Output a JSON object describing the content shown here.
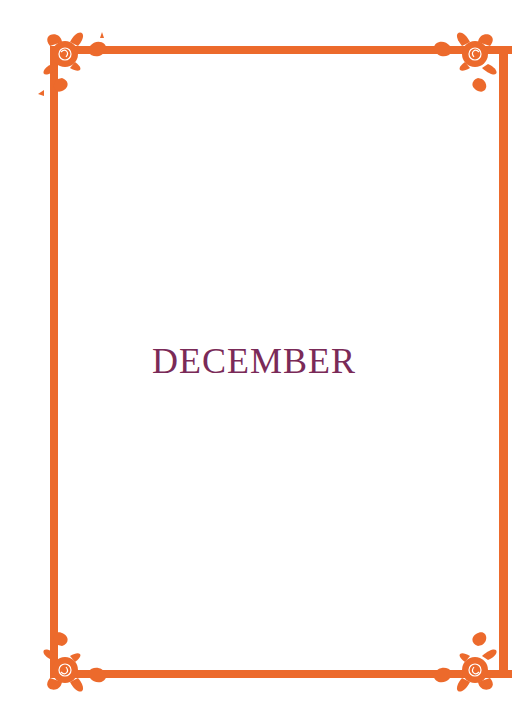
{
  "page": {
    "title": "DECEMBER"
  },
  "colors": {
    "frame": "#ec6a2c",
    "title_text": "#7a2a58",
    "background": "#ffffff"
  },
  "decorations": {
    "corner_ornament": "rose-lily-floral"
  }
}
